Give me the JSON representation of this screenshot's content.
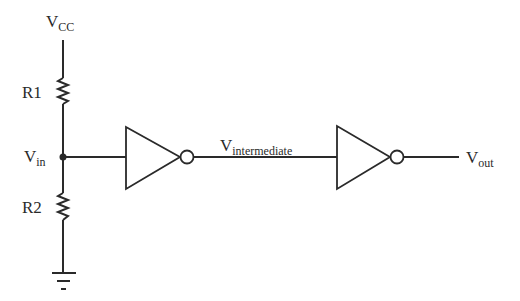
{
  "diagram": {
    "type": "circuit-schematic",
    "labels": {
      "vcc": {
        "main": "V",
        "sub": "CC"
      },
      "vin": {
        "main": "V",
        "sub": "in"
      },
      "vintermediate": {
        "main": "V",
        "sub": "intermediate"
      },
      "vout": {
        "main": "V",
        "sub": "out"
      },
      "r1": "R1",
      "r2": "R2"
    },
    "components": [
      {
        "id": "R1",
        "kind": "resistor"
      },
      {
        "id": "R2",
        "kind": "resistor"
      },
      {
        "id": "INV1",
        "kind": "inverter"
      },
      {
        "id": "INV2",
        "kind": "inverter"
      },
      {
        "id": "GND",
        "kind": "ground"
      }
    ],
    "connections": [
      [
        "Vcc",
        "R1"
      ],
      [
        "R1",
        "Vin"
      ],
      [
        "Vin",
        "R2"
      ],
      [
        "R2",
        "GND"
      ],
      [
        "Vin",
        "INV1"
      ],
      [
        "INV1",
        "Vintermediate"
      ],
      [
        "Vintermediate",
        "INV2"
      ],
      [
        "INV2",
        "Vout"
      ]
    ],
    "colors": {
      "ink": "#2a2a2a",
      "background": "#ffffff"
    }
  }
}
